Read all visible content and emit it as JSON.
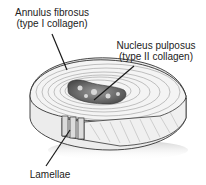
{
  "diagram": {
    "labels": {
      "annulus": {
        "line1": "Annulus fibrosus",
        "line2": "(type I collagen)"
      },
      "nucleus": {
        "line1": "Nucleus pulposus",
        "line2": "(type II collagen)"
      },
      "lamellae": {
        "line1": "Lamellae"
      }
    },
    "colors": {
      "line": "#1a1a1a",
      "disc_top": "#f2f2f2",
      "disc_side": "#e6e6e6",
      "nucleus": "#6e6e6e",
      "shadow": "#d9d9d9"
    }
  }
}
